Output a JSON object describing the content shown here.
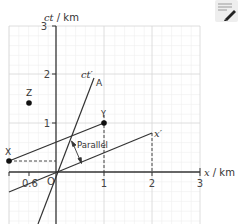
{
  "diagram": {
    "type": "spacetime-diagram",
    "y_axis": {
      "label_var": "ct",
      "label_unit": " / km",
      "ticks": [
        "1",
        "2",
        "3"
      ]
    },
    "x_axis": {
      "label_var": "x",
      "label_unit": " / km",
      "ticks": [
        "0.6",
        "1",
        "2",
        "3"
      ],
      "origin_label": "O"
    },
    "primed_axes": {
      "ct_prime_label": "ct′",
      "x_prime_label": "x′",
      "velocity_fraction": 0.4
    },
    "events": [
      {
        "label": "A",
        "x": 0.75,
        "ct": 1.9
      },
      {
        "label": "Y",
        "x": 1.0,
        "ct": 1.0
      },
      {
        "label": "X",
        "x": -0.96,
        "ct": 0.23
      },
      {
        "label": "Z",
        "x": -0.55,
        "ct": 1.4
      }
    ],
    "annotation": {
      "text": "Parallel"
    },
    "colors": {
      "axis": "#333333",
      "grid_major": "#cccccc",
      "grid_minor": "#eeeeee",
      "line": "#333333",
      "dash": "#333333"
    }
  },
  "toolbar": {
    "notes_icon": "notes-edit-icon"
  }
}
